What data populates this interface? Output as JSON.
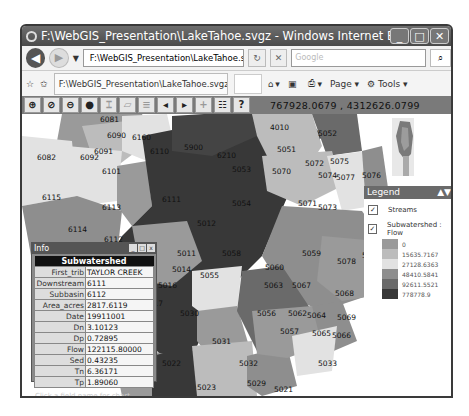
{
  "window": {
    "title": "F:\\WebGIS_Presentation\\LakeTahoe.svgz - Windows Internet Explorer provided by...",
    "controls": [
      "minimize",
      "maximize",
      "close"
    ]
  },
  "nav": {
    "address": "F:\\WebGIS_Presentation\\LakeTahoe.svgz",
    "search_placeholder": "Google",
    "back_icon": "back-arrow-icon",
    "forward_icon": "forward-arrow-icon"
  },
  "tabbar": {
    "tab_label": "F:\\WebGIS_Presentation\\LakeTahoe.svgz",
    "page_label": "Page",
    "tools_label": "Tools"
  },
  "map_toolbar": {
    "tools": [
      {
        "name": "zoom-in",
        "glyph": "⊕"
      },
      {
        "name": "zoom-box",
        "glyph": "⊘"
      },
      {
        "name": "zoom-out",
        "glyph": "⊖"
      },
      {
        "name": "info",
        "glyph": "❶"
      },
      {
        "name": "measure",
        "glyph": "⌶"
      },
      {
        "name": "area",
        "glyph": "▱"
      },
      {
        "name": "layers",
        "glyph": "≡"
      },
      {
        "name": "pan-left",
        "glyph": "◂"
      },
      {
        "name": "pan-right",
        "glyph": "▸"
      },
      {
        "name": "add-point",
        "glyph": "+"
      },
      {
        "name": "legend",
        "glyph": "☷"
      },
      {
        "name": "help",
        "glyph": "?"
      }
    ],
    "coord_x": "767928.0679",
    "coord_y": "4312626.0799"
  },
  "legend": {
    "title": "Legend",
    "layers": [
      {
        "label": "Streams",
        "checked": true
      },
      {
        "label": "Subwatershed : Flow",
        "checked": true
      }
    ],
    "classes": [
      {
        "label": "0",
        "color": "#9a9a9a"
      },
      {
        "label": "15635.7167",
        "color": "#bcbcbc"
      },
      {
        "label": "27128.6363",
        "color": "#e2e2e2"
      },
      {
        "label": "48410.5841",
        "color": "#8e8e8e"
      },
      {
        "label": "92611.5521",
        "color": "#6a6a6a"
      },
      {
        "label": "778778.9",
        "color": "#383838"
      }
    ]
  },
  "info": {
    "title": "Info",
    "header": "Subwatershed",
    "rows": [
      {
        "k": "First_trib",
        "v": "TAYLOR CREEK"
      },
      {
        "k": "Downstream",
        "v": "6111"
      },
      {
        "k": "Subbasin",
        "v": "6112"
      },
      {
        "k": "Area_acres",
        "v": "2817.6119"
      },
      {
        "k": "Date",
        "v": "19911001"
      },
      {
        "k": "Dn",
        "v": "3.10123"
      },
      {
        "k": "Dp",
        "v": "0.72895"
      },
      {
        "k": "Flow",
        "v": "122115.80000"
      },
      {
        "k": "Sed",
        "v": "0.43235"
      },
      {
        "k": "Tn",
        "v": "6.36171"
      },
      {
        "k": "Tp",
        "v": "1.89060"
      }
    ],
    "footer": "Click a field name for chart"
  },
  "map_labels": [
    "6081",
    "6090",
    "6160",
    "6091",
    "6110",
    "5900",
    "6210",
    "4010",
    "5052",
    "6082",
    "6092",
    "6101",
    "5051",
    "5072",
    "5075",
    "5053",
    "5070",
    "5074",
    "5077",
    "5076",
    "6115",
    "6111",
    "5054",
    "5071",
    "5073",
    "6113",
    "5012",
    "6114",
    "6112",
    "5011",
    "5058",
    "5059",
    "5078",
    "5079",
    "5013",
    "5014",
    "5055",
    "5060",
    "5015",
    "5016",
    "5063",
    "5067",
    "5068",
    "5017",
    "5056",
    "5062",
    "5064",
    "5069",
    "5030",
    "5057",
    "5065",
    "5066",
    "5031",
    "5032",
    "5033",
    "5022",
    "5029",
    "5023",
    "5021"
  ]
}
